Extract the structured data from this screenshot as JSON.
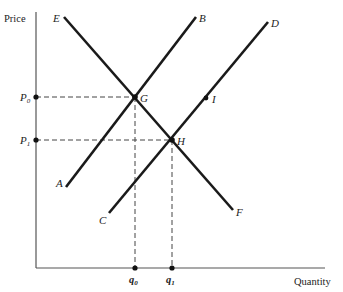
{
  "axes": {
    "y_label": "Price",
    "x_label": "Quantity"
  },
  "curves": [
    {
      "name": "EF",
      "start_label": "E",
      "end_label": "F",
      "type": "demand"
    },
    {
      "name": "AB",
      "start_label": "A",
      "end_label": "B",
      "type": "supply"
    },
    {
      "name": "CD",
      "start_label": "C",
      "end_label": "D",
      "type": "supply"
    }
  ],
  "points": {
    "G": "G",
    "H": "H",
    "I": "I"
  },
  "price_levels": {
    "p0": {
      "base": "P",
      "sub": "0"
    },
    "p1": {
      "base": "P",
      "sub": "1"
    }
  },
  "quantity_levels": {
    "q0": {
      "base": "q",
      "sub": "0"
    },
    "q1": {
      "base": "q",
      "sub": "1"
    }
  },
  "labels": {
    "E": "E",
    "F": "F",
    "A": "A",
    "B": "B",
    "C": "C",
    "D": "D"
  }
}
